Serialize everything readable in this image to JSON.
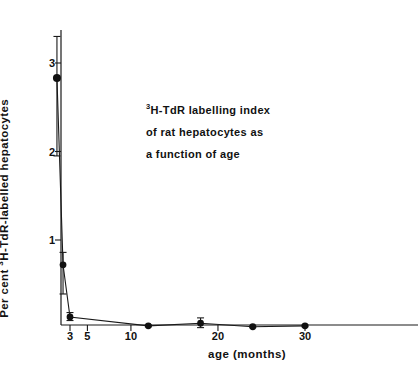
{
  "figure": {
    "annotation_lines": [
      "H-TdR labelling index",
      "of rat hepatocytes as",
      "a function of age"
    ],
    "annotation_superscript": "3",
    "ylabel_prefix": "Per cent ",
    "ylabel_superscript": "3",
    "ylabel_suffix": "H-TdR-labelled hepatocytes",
    "xlabel": "age (months)"
  },
  "chart_data": {
    "type": "line",
    "title": "3H-TdR labelling index of rat hepatocytes as a function of age",
    "xlabel": "age (months)",
    "ylabel": "Per cent 3H-TdR-labelled hepatocytes",
    "xlim": [
      0,
      40
    ],
    "ylim": [
      0,
      3.45
    ],
    "grid": false,
    "legend": null,
    "xticks": [
      3,
      5,
      10,
      20,
      30
    ],
    "xticklabels": [
      "3",
      "5",
      "10",
      "20",
      "30"
    ],
    "yticks": [
      1,
      2,
      3
    ],
    "yticklabels": [
      "1",
      "2",
      "3"
    ],
    "error_bar_style": "vertical with caps",
    "marker": "filled circle",
    "series": [
      {
        "name": "3H-TdR labelling index",
        "x": [
          1.5,
          2.2,
          3.0,
          12.0,
          18.0,
          24.0,
          30.0
        ],
        "y": [
          2.83,
          0.72,
          0.13,
          0.03,
          0.06,
          0.02,
          0.03
        ],
        "yerr_low": [
          0.88,
          0.33,
          0.04,
          0.01,
          0.05,
          0.01,
          0.01
        ],
        "yerr_high": [
          0.47,
          0.14,
          0.05,
          0.01,
          0.06,
          0.01,
          0.01
        ]
      }
    ]
  }
}
